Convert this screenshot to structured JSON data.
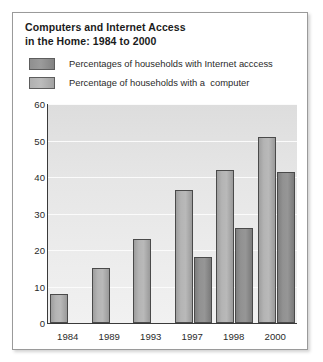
{
  "title": {
    "line1": "Computers and Internet Access",
    "line2": "in the Home: 1984 to 2000"
  },
  "legend": [
    {
      "label": "Percentages of households with Internet acccess",
      "swatch": "internet-swatch",
      "color": "#8f8f8f"
    },
    {
      "label": "Percentage of households with a  computer",
      "swatch": "computer-swatch",
      "color": "#b0b0b0"
    }
  ],
  "chart_data": {
    "type": "bar",
    "title": "Computers and Internet Access in the Home: 1984 to 2000",
    "xlabel": "",
    "ylabel": "",
    "categories": [
      "1984",
      "1989",
      "1993",
      "1997",
      "1998",
      "2000"
    ],
    "series": [
      {
        "name": "Percentage of households with a  computer",
        "color": "#b0b0b0",
        "values": [
          8,
          15,
          23,
          36.5,
          42,
          51
        ]
      },
      {
        "name": "Percentages of households with Internet acccess",
        "color": "#8f8f8f",
        "values": [
          null,
          null,
          null,
          18,
          26,
          41.5
        ]
      }
    ],
    "ylim": [
      0,
      60
    ],
    "yticks": [
      0,
      10,
      20,
      30,
      40,
      50,
      60
    ],
    "grid": true,
    "legend_position": "top"
  }
}
